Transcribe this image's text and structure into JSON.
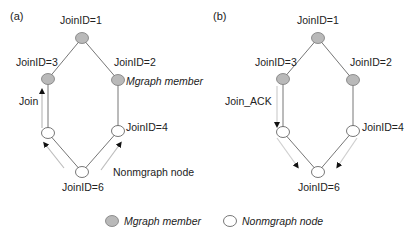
{
  "panels": [
    {
      "label": "(a)",
      "nodes": [
        {
          "id": "JoinID=1",
          "type": "Mgraph member"
        },
        {
          "id": "JoinID=2",
          "type": "Mgraph member"
        },
        {
          "id": "JoinID=3",
          "type": "Mgraph member"
        },
        {
          "id": "JoinID=4",
          "type": "Nonmgraph node"
        },
        {
          "id": "unlabeled-left",
          "type": "Nonmgraph node"
        },
        {
          "id": "JoinID=6",
          "type": "Nonmgraph node"
        }
      ],
      "message": "Join",
      "annotations": {
        "mgraph_member": "Mgraph member",
        "nonmgraph_node": "Nonmgraph node"
      }
    },
    {
      "label": "(b)",
      "nodes": [
        {
          "id": "JoinID=1",
          "type": "Mgraph member"
        },
        {
          "id": "JoinID=2",
          "type": "Mgraph member"
        },
        {
          "id": "JoinID=3",
          "type": "Mgraph member"
        },
        {
          "id": "JoinID=4",
          "type": "Nonmgraph node"
        },
        {
          "id": "unlabeled-left",
          "type": "Nonmgraph node"
        },
        {
          "id": "JoinID=6",
          "type": "Nonmgraph node"
        }
      ],
      "message": "Join_ACK"
    }
  ],
  "labels": {
    "a": {
      "panel": "(a)",
      "n1": "JoinID=1",
      "n2": "JoinID=2",
      "n3": "JoinID=3",
      "n4": "JoinID=4",
      "n6": "JoinID=6",
      "msg": "Join",
      "mgraph_note": "Mgraph member",
      "nonmgraph_note": "Nonmgraph node"
    },
    "b": {
      "panel": "(b)",
      "n1": "JoinID=1",
      "n2": "JoinID=2",
      "n3": "JoinID=3",
      "n4": "JoinID=4",
      "n6": "JoinID=6",
      "msg": "Join_ACK"
    }
  },
  "legend": {
    "mgraph": "Mgraph member",
    "nonmgraph": "Nonmgraph node"
  },
  "colors": {
    "member_fill": "#b9b9b9",
    "member_stroke": "#7a7a7a",
    "nonmember_fill": "#ffffff",
    "nonmember_stroke": "#555555",
    "edge": "#555555",
    "arrow_shaft": "#c8c8c8",
    "arrow_head": "#111111"
  }
}
